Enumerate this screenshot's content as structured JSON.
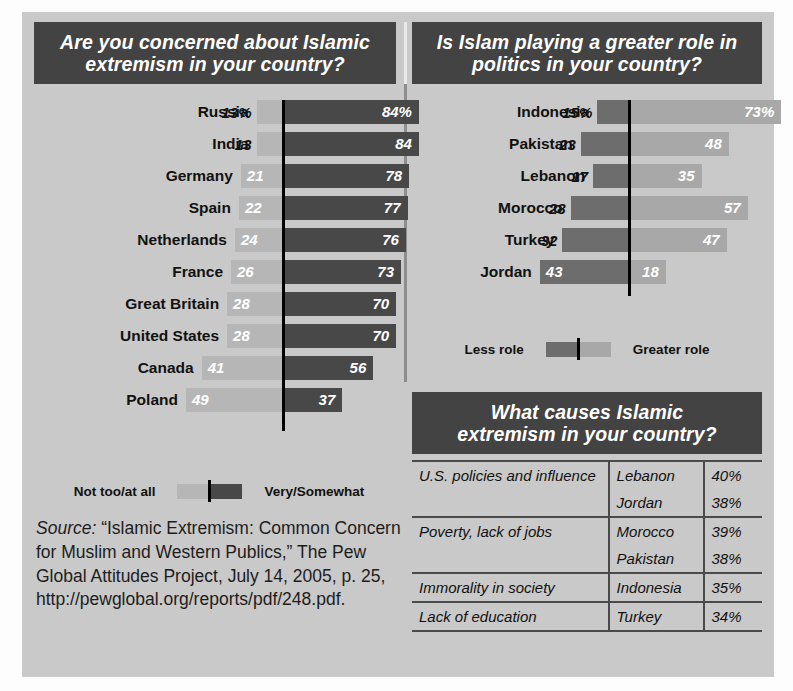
{
  "colors": {
    "panel_bg": "#c9c9c9",
    "header_bg": "#434343",
    "dark_bar": "#484848",
    "light_bar": "#b6b6b6",
    "mid_bar": "#6d6d6d",
    "pale_bar": "#a8a8a8",
    "axis": "#000000"
  },
  "left_panel": {
    "title_line1": "Are you concerned about Islamic",
    "title_line2": "extremism in your country?",
    "legend": {
      "left_label": "Not too/at all",
      "right_label": "Very/Somewhat"
    }
  },
  "right_panel": {
    "title_line1": "Is Islam playing a greater role in",
    "title_line2": "politics in your country?",
    "legend": {
      "left_label": "Less role",
      "right_label": "Greater role"
    }
  },
  "table_panel": {
    "title_line1": "What causes Islamic",
    "title_line2": "extremism in your country?"
  },
  "source": {
    "label": "Source:",
    "text": " “Islamic Extremism: Common Concern for Muslim and Western Publics,” The Pew Global Attitudes Project, July 14, 2005, p. 25, http://pewglobal.org/reports/pdf/248.pdf."
  },
  "chart_data": [
    {
      "id": "concern",
      "type": "bar",
      "orientation": "horizontal-diverging",
      "title": "Are you concerned about Islamic extremism in your country?",
      "categories": [
        "Russia",
        "India",
        "Germany",
        "Spain",
        "Netherlands",
        "France",
        "Great Britain",
        "United States",
        "Canada",
        "Poland"
      ],
      "series": [
        {
          "name": "Not too/at all",
          "side": "left",
          "color": "#b6b6b6",
          "values": [
            13,
            13,
            21,
            22,
            24,
            26,
            28,
            28,
            41,
            49
          ],
          "labels": [
            "13%",
            "13",
            "21",
            "22",
            "24",
            "26",
            "28",
            "28",
            "41",
            "49"
          ]
        },
        {
          "name": "Very/Somewhat",
          "side": "right",
          "color": "#484848",
          "values": [
            84,
            84,
            78,
            77,
            76,
            73,
            70,
            70,
            56,
            37
          ],
          "labels": [
            "84%",
            "84",
            "78",
            "77",
            "76",
            "73",
            "70",
            "70",
            "56",
            "37"
          ]
        }
      ],
      "xlabel": "",
      "ylabel": "",
      "grid": false,
      "legend_position": "bottom",
      "units": "percent"
    },
    {
      "id": "greater-role",
      "type": "bar",
      "orientation": "horizontal-diverging",
      "title": "Is Islam playing a greater role in politics in your country?",
      "categories": [
        "Indonesia",
        "Pakistan",
        "Lebanon",
        "Morocco",
        "Turkey",
        "Jordan"
      ],
      "series": [
        {
          "name": "Less role",
          "side": "left",
          "color": "#6d6d6d",
          "values": [
            15,
            23,
            17,
            28,
            32,
            43
          ],
          "labels": [
            "15%",
            "23",
            "17",
            "28",
            "32",
            "43"
          ]
        },
        {
          "name": "Greater role",
          "side": "right",
          "color": "#a8a8a8",
          "values": [
            73,
            48,
            35,
            57,
            47,
            18
          ],
          "labels": [
            "73%",
            "48",
            "35",
            "57",
            "47",
            "18"
          ]
        }
      ],
      "xlabel": "",
      "ylabel": "",
      "grid": false,
      "legend_position": "bottom",
      "units": "percent"
    },
    {
      "id": "causes",
      "type": "table",
      "title": "What causes Islamic extremism in your country?",
      "rows": [
        {
          "cause": "U.S. policies and influence",
          "country": "Lebanon",
          "pct": "40%",
          "group_start": true,
          "group_end": false
        },
        {
          "cause": "",
          "country": "Jordan",
          "pct": "38%",
          "group_start": false,
          "group_end": true
        },
        {
          "cause": "Poverty, lack of jobs",
          "country": "Morocco",
          "pct": "39%",
          "group_start": false,
          "group_end": false
        },
        {
          "cause": "",
          "country": "Pakistan",
          "pct": "38%",
          "group_start": false,
          "group_end": true
        },
        {
          "cause": "Immorality in society",
          "country": "Indonesia",
          "pct": "35%",
          "group_start": false,
          "group_end": true
        },
        {
          "cause": "Lack of education",
          "country": "Turkey",
          "pct": "34%",
          "group_start": false,
          "group_end": true
        }
      ]
    }
  ]
}
